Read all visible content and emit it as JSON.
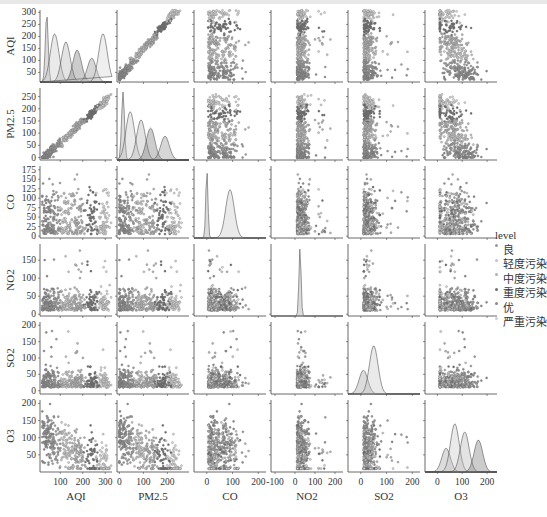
{
  "chart_data": {
    "type": "scatter",
    "subtype": "pairplot",
    "title": "",
    "variables": [
      "AQI",
      "PM2.5",
      "CO",
      "NO2",
      "SO2",
      "O3"
    ],
    "hue": "level",
    "diagonal": "kde",
    "offdiagonal": "scatter",
    "legend": {
      "title": "level",
      "position": "right",
      "entries": [
        "良",
        "轻度污染",
        "中度污染",
        "重度污染",
        "优",
        "严重污染"
      ]
    },
    "axes": {
      "AQI": {
        "ylim": [
          10,
          310
        ],
        "yticks": [
          50,
          100,
          150,
          200,
          250,
          300
        ],
        "xlim": [
          10,
          330
        ],
        "xticks": [
          100,
          200,
          300
        ]
      },
      "PM2.5": {
        "ylim": [
          -10,
          285
        ],
        "yticks": [
          0,
          50,
          100,
          150,
          200,
          250
        ],
        "xlim": [
          -10,
          290
        ],
        "xticks": [
          0,
          100,
          200
        ]
      },
      "CO": {
        "ylim": [
          -5,
          185
        ],
        "yticks": [
          0,
          25,
          50,
          75,
          100,
          125,
          150,
          175
        ],
        "xlim": [
          -50,
          230
        ],
        "xticks": [
          0,
          100,
          200
        ]
      },
      "NO2": {
        "ylim": [
          -5,
          195
        ],
        "yticks": [
          0,
          50,
          100,
          150
        ],
        "xlim": [
          -120,
          240
        ],
        "xticks": [
          -100,
          0,
          100,
          200
        ]
      },
      "SO2": {
        "ylim": [
          -10,
          210
        ],
        "yticks": [
          0,
          50,
          100,
          150,
          200
        ],
        "xlim": [
          -50,
          230
        ],
        "xticks": [
          0,
          100,
          200
        ]
      },
      "O3": {
        "ylim": [
          0,
          210
        ],
        "yticks": [
          50,
          100,
          150,
          200
        ],
        "xlim": [
          -50,
          240
        ],
        "xticks": [
          0,
          100,
          200
        ]
      }
    },
    "diagonal_peaks": {
      "AQI": [
        {
          "level": "优",
          "x": 40
        },
        {
          "level": "良",
          "x": 75
        },
        {
          "level": "轻度污染",
          "x": 125
        },
        {
          "level": "中度污染",
          "x": 175
        },
        {
          "level": "重度污染",
          "x": 240
        },
        {
          "level": "严重污染",
          "x": 290
        }
      ],
      "PM2.5": [
        {
          "level": "优",
          "x": 15
        },
        {
          "level": "良",
          "x": 45
        },
        {
          "level": "轻度污染",
          "x": 90
        },
        {
          "level": "中度污染",
          "x": 130
        },
        {
          "level": "重度污染",
          "x": 190
        }
      ],
      "CO": [
        {
          "x": 0,
          "note": "sharp peak"
        },
        {
          "x": 90,
          "note": "secondary peak"
        }
      ],
      "NO2": [
        {
          "x": 25,
          "note": "sharp peak"
        }
      ],
      "SO2": [
        {
          "x": 10
        },
        {
          "x": 50
        }
      ],
      "O3": [
        {
          "x": 35
        },
        {
          "x": 70
        },
        {
          "x": 110
        },
        {
          "x": 165
        }
      ]
    },
    "scatter_trends": {
      "AQI_vs_PM2.5": "strong positive linear, max ~ (300, 280)",
      "others": "dense clusters near low values with outliers"
    },
    "grid": false
  },
  "legend": {
    "title": "level",
    "items": [
      {
        "label": "良",
        "color": "#9a9a9a"
      },
      {
        "label": "轻度污染",
        "color": "#c4c4c4"
      },
      {
        "label": "中度污染",
        "color": "#b0b0b0"
      },
      {
        "label": "重度污染",
        "color": "#6e6e6e"
      },
      {
        "label": "优",
        "color": "#8a8a8a"
      },
      {
        "label": "严重污染",
        "color": "#d0d0d0"
      }
    ]
  },
  "labels": {
    "y": [
      "AQI",
      "PM2.5",
      "CO",
      "NO2",
      "SO2",
      "O3"
    ],
    "x": [
      "AQI",
      "PM2.5",
      "CO",
      "NO2",
      "SO2",
      "O3"
    ]
  }
}
